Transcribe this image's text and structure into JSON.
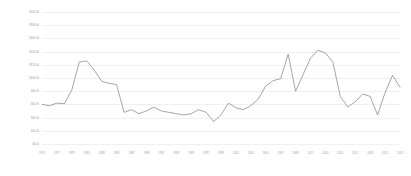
{
  "chart_data": {
    "type": "line",
    "title": "",
    "subtitle": "",
    "xlabel": "",
    "ylabel": "",
    "grid": true,
    "legend": false,
    "legend_position": "none",
    "line_color": "#808084",
    "grid_color": "#f0f0f2",
    "tick_label_color": "#9a9a9e",
    "background_color": "#ffffff",
    "ylim": [
      0,
      200
    ],
    "ytick_step": 20,
    "ytick_labels": [
      "$200.00",
      "$180.00",
      "$160.00",
      "$140.00",
      "$120.00",
      "$100.00",
      "$80.00",
      "$60.00",
      "$40.00",
      "$20.00",
      "$0.00"
    ],
    "ytick_values": [
      200,
      180,
      160,
      140,
      120,
      100,
      80,
      60,
      40,
      20,
      0
    ],
    "xlim": [
      1975,
      2023
    ],
    "xtick_labels": [
      "1975",
      "1977",
      "1979",
      "1981",
      "1983",
      "1985",
      "1987",
      "1989",
      "1991",
      "1993",
      "1995",
      "1997",
      "1999",
      "2001",
      "2003",
      "2005",
      "2007",
      "2009",
      "2011",
      "2013",
      "2015",
      "2017",
      "2019",
      "2021",
      "2023"
    ],
    "xtick_values": [
      1975,
      1977,
      1979,
      1981,
      1983,
      1985,
      1987,
      1989,
      1991,
      1993,
      1995,
      1997,
      1999,
      2001,
      2003,
      2005,
      2007,
      2009,
      2011,
      2013,
      2015,
      2017,
      2019,
      2021,
      2023
    ],
    "x": [
      1975,
      1976,
      1977,
      1978,
      1979,
      1980,
      1981,
      1982,
      1983,
      1984,
      1985,
      1986,
      1987,
      1988,
      1989,
      1990,
      1991,
      1992,
      1993,
      1994,
      1995,
      1996,
      1997,
      1998,
      1999,
      2000,
      2001,
      2002,
      2003,
      2004,
      2005,
      2006,
      2007,
      2008,
      2009,
      2010,
      2011,
      2012,
      2013,
      2014,
      2015,
      2016,
      2017,
      2018,
      2019,
      2020,
      2021,
      2022,
      2023
    ],
    "values": [
      60,
      58,
      62,
      61,
      82,
      124,
      126,
      112,
      95,
      92,
      90,
      48,
      52,
      46,
      50,
      56,
      50,
      48,
      46,
      44,
      46,
      52,
      48,
      34,
      44,
      62,
      55,
      52,
      58,
      68,
      88,
      96,
      99,
      136,
      80,
      105,
      130,
      142,
      138,
      124,
      72,
      56,
      64,
      76,
      72,
      44,
      78,
      104,
      86
    ],
    "series_name": "price"
  }
}
